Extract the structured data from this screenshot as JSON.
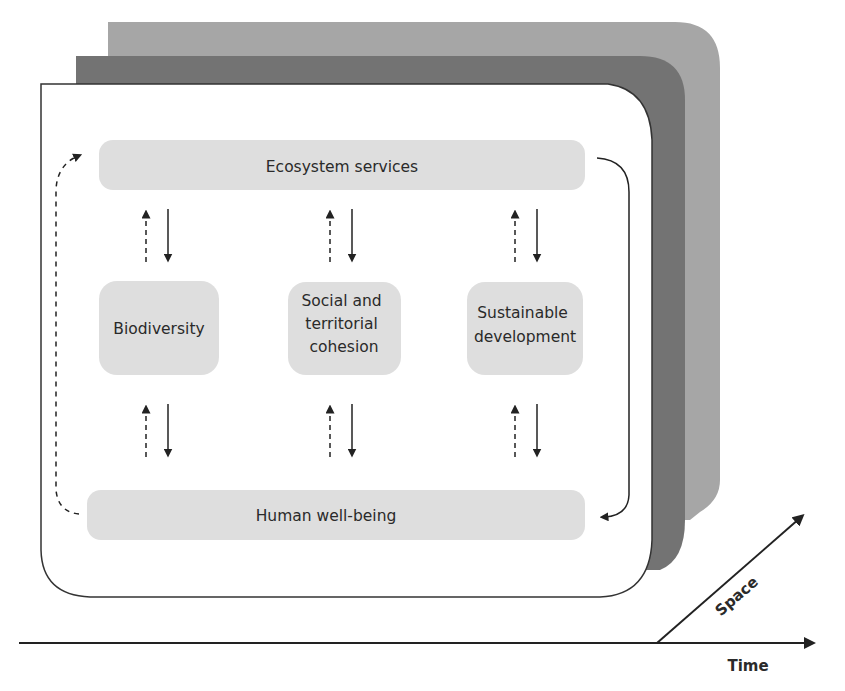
{
  "diagram": {
    "layers": [
      {
        "name": "back-layer",
        "color": "#a6a6a6"
      },
      {
        "name": "middle-layer",
        "color": "#737373"
      },
      {
        "name": "front-layer",
        "color": "#ffffff",
        "border": "#333333"
      }
    ],
    "box_color": "#dedede",
    "text_color": "#2a2a2a",
    "line_color": "#222222",
    "top_box": {
      "label": "Ecosystem services"
    },
    "bottom_box": {
      "label": "Human well-being"
    },
    "middle_boxes": [
      {
        "lines": [
          "Biodiversity"
        ]
      },
      {
        "lines": [
          "Social and",
          "territorial",
          "cohesion"
        ]
      },
      {
        "lines": [
          "Sustainable",
          "development"
        ]
      }
    ],
    "arrows": {
      "dashed": "upward (dashed)",
      "solid": "downward (solid)",
      "loop_left": "dashed, from Human well-being up to Ecosystem services",
      "loop_right": "solid, from Ecosystem services down to Human well-being"
    },
    "axes": {
      "x_label": "Time",
      "diagonal_label": "Space"
    }
  }
}
